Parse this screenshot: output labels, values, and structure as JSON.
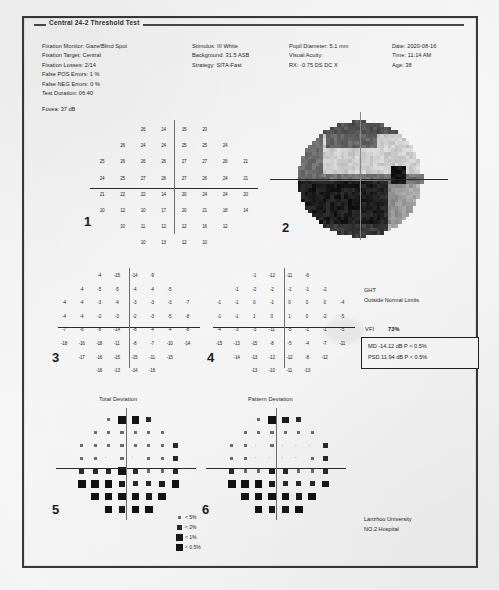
{
  "report": {
    "title": "Central 24-2 Threshold Test",
    "header": {
      "column1": [
        "Fixation Monitor: Gaze/Blind Spot",
        "Fixation Target: Central",
        "Fixation Losses: 2/14",
        "False POS Errors: 1 %",
        "False NEG Errors: 0 %",
        "Test Duration: 06:40"
      ],
      "fovea": "Fovea: 37 dB",
      "column2": [
        "Stimulus: III White",
        "Background: 31.5 ASB",
        "Strategy: SITA-Fast"
      ],
      "column3": [
        "Pupil Diameter: 5.1 mm",
        "Visual Acuity:",
        "RX:  -0.75 DS     DC X"
      ],
      "column4": [
        "Date: 2020-08-16",
        "Time: 11:14 AM",
        "Age: 38"
      ]
    },
    "panels": {
      "p1": {
        "number": "1",
        "name": "threshold-sensitivity-numeric"
      },
      "p2": {
        "number": "2",
        "name": "grayscale-map"
      },
      "p3": {
        "number": "3",
        "name": "total-deviation-numeric"
      },
      "p4": {
        "number": "4",
        "name": "pattern-deviation-numeric"
      },
      "p5": {
        "number": "5",
        "name": "total-deviation-plot",
        "label": "Total Deviation"
      },
      "p6": {
        "number": "6",
        "name": "pattern-deviation-plot",
        "label": "Pattern Deviation"
      }
    },
    "ght": {
      "label": "GHT",
      "value": "Outside Normal Limits"
    },
    "indices": {
      "vfi_label": "VFI",
      "vfi_value": "73%",
      "md": "MD    -14.12 dB  P < 0.5%",
      "psd": "PSD   11.94 dB  P < 0.5%"
    },
    "legend": [
      {
        "symbol": "p5",
        "text": "< 5%"
      },
      {
        "symbol": "p2",
        "text": "< 2%"
      },
      {
        "symbol": "p1",
        "text": "< 1%"
      },
      {
        "symbol": "p05",
        "text": "< 0.5%"
      }
    ],
    "footer": [
      "Lanzhou University",
      "NO.2 Hospital"
    ]
  },
  "chart_data": {
    "type": "table",
    "axis_note": "Each plot is a 24-2 test grid: 6 columns x 8 rows pattern, horizontal and vertical meridian axes drawn through fixation.",
    "threshold_sensitivity_db": {
      "description": "Panel 1 — raw retinal sensitivity in decibels at each test location",
      "rows": [
        [
          null,
          null,
          "26",
          "14",
          "15",
          "20",
          null,
          null
        ],
        [
          null,
          "26",
          "24",
          "24",
          "25",
          "25",
          "24",
          null
        ],
        [
          "25",
          "26",
          "26",
          "26",
          "27",
          "27",
          "26",
          "21"
        ],
        [
          "24",
          "25",
          "27",
          "26",
          "27",
          "26",
          "24",
          "21"
        ],
        [
          "21",
          "22",
          "22",
          "14",
          "20",
          "24",
          "24",
          "20"
        ],
        [
          "10",
          "12",
          "10",
          "17",
          "20",
          "21",
          "18",
          "14"
        ],
        [
          null,
          "10",
          "11",
          "12",
          "12",
          "16",
          "12",
          null
        ],
        [
          null,
          null,
          "10",
          "13",
          "12",
          "10",
          null,
          null
        ]
      ]
    },
    "total_deviation_db": {
      "description": "Panel 3 — total deviation from age-matched normal, in dB",
      "rows": [
        [
          null,
          null,
          "-4",
          "-15",
          "-14",
          "-9",
          null,
          null
        ],
        [
          null,
          "-4",
          "-5",
          "-5",
          "-4",
          "-4",
          "-5",
          null
        ],
        [
          "-4",
          "-4",
          "-3",
          "-4",
          "-3",
          "-3",
          "-3",
          "-7"
        ],
        [
          "-4",
          "-4",
          "-2",
          "-3",
          "-2",
          "-3",
          "-5",
          "-8"
        ],
        [
          "-7",
          "-6",
          "-6",
          "-14",
          "-8",
          "-4",
          "-4",
          "-8"
        ],
        [
          "-18",
          "-16",
          "-18",
          "-11",
          "-8",
          "-7",
          "-10",
          "-14"
        ],
        [
          null,
          "-17",
          "-16",
          "-15",
          "-15",
          "-11",
          "-15",
          null
        ],
        [
          null,
          null,
          "-16",
          "-13",
          "-14",
          "-16",
          null,
          null
        ]
      ]
    },
    "pattern_deviation_db": {
      "description": "Panel 4 — pattern deviation after overall height correction, in dB",
      "rows": [
        [
          null,
          null,
          "-1",
          "-12",
          "-11",
          "-6",
          null,
          null
        ],
        [
          null,
          "-1",
          "-2",
          "-2",
          "-1",
          "-1",
          "-2",
          null
        ],
        [
          "-1",
          "-1",
          "0",
          "-1",
          "0",
          "0",
          "0",
          "-4"
        ],
        [
          "-1",
          "-1",
          "1",
          "0",
          "1",
          "0",
          "-2",
          "-5"
        ],
        [
          "-4",
          "-3",
          "-3",
          "-11",
          "-5",
          "-1",
          "-1",
          "-5"
        ],
        [
          "-15",
          "-13",
          "-15",
          "-8",
          "-5",
          "-4",
          "-7",
          "-11"
        ],
        [
          null,
          "-14",
          "-13",
          "-12",
          "-12",
          "-8",
          "-12",
          null
        ],
        [
          null,
          null,
          "-13",
          "-10",
          "-11",
          "-13",
          null,
          null
        ]
      ]
    },
    "grayscale_note": "Panel 2 — dense black (deep loss) occupies the inferior hemifield and the inferonasal quadrant; superior field is light gray (near normal). Blind spot visible temporally.",
    "probability_levels": [
      "< 5%",
      "< 2%",
      "< 1%",
      "< 0.5%"
    ],
    "summary_indices": {
      "VFI": 73,
      "MD": -14.12,
      "PSD": 11.94,
      "GHT": "Outside Normal Limits"
    }
  }
}
